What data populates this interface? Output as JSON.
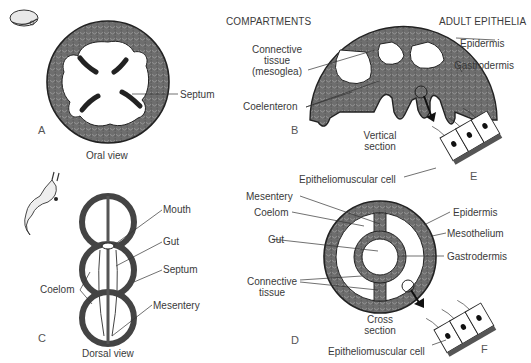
{
  "headers": {
    "compartments": "COMPARTMENTS",
    "adult_epithelia": "ADULT EPITHELIA"
  },
  "panels": {
    "A": {
      "letter": "A",
      "caption": "Oral view",
      "labels": {
        "septum": "Septum"
      }
    },
    "B": {
      "letter": "B",
      "caption_line1": "Vertical",
      "caption_line2": "section",
      "labels": {
        "connective_line1": "Connective",
        "connective_line2": "tissue",
        "connective_line3": "(mesoglea)",
        "coelenteron": "Coelenteron",
        "epidermis": "Epidermis",
        "gastrodermis": "Gastrodermis"
      }
    },
    "E": {
      "letter": "E",
      "labels": {
        "epitheliomuscular": "Epitheliomuscular cell"
      }
    },
    "C": {
      "letter": "C",
      "caption": "Dorsal view",
      "labels": {
        "mouth": "Mouth",
        "gut": "Gut",
        "septum": "Septum",
        "coelom": "Coelom",
        "mesentery": "Mesentery"
      }
    },
    "D": {
      "letter": "D",
      "caption_line1": "Cross",
      "caption_line2": "section",
      "labels": {
        "mesentery": "Mesentery",
        "coelom": "Coelom",
        "gut": "Gut",
        "connective_line1": "Connective",
        "connective_line2": "tissue",
        "epidermis": "Epidermis",
        "mesothelium": "Mesothelium",
        "gastrodermis": "Gastrodermis"
      }
    },
    "F": {
      "letter": "F",
      "labels": {
        "epitheliomuscular": "Epitheliomuscular cell"
      }
    }
  },
  "colors": {
    "tissue_fill": "#7a7a7a",
    "outline": "#2a2a2a",
    "text": "#3a3a3a",
    "background": "#ffffff"
  }
}
